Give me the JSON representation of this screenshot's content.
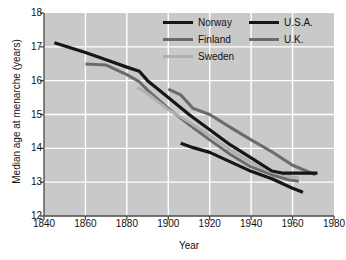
{
  "chart_data": {
    "type": "line",
    "title": "",
    "xlabel": "Year",
    "ylabel": "Median age at menarche (years)",
    "xlim": [
      1840,
      1980
    ],
    "ylim": [
      12,
      18
    ],
    "xticks": [
      1840,
      1860,
      1880,
      1900,
      1920,
      1940,
      1960,
      1980
    ],
    "yticks": [
      12,
      13,
      14,
      15,
      16,
      17,
      18
    ],
    "grid": true,
    "legend_position": "top-right",
    "series": [
      {
        "name": "Norway",
        "color": "#161616",
        "width": 3.2,
        "points": [
          [
            1845,
            17.12
          ],
          [
            1860,
            16.83
          ],
          [
            1870,
            16.62
          ],
          [
            1880,
            16.4
          ],
          [
            1886,
            16.28
          ],
          [
            1890,
            16.0
          ],
          [
            1900,
            15.5
          ],
          [
            1910,
            15.0
          ],
          [
            1920,
            14.55
          ],
          [
            1930,
            14.1
          ],
          [
            1940,
            13.72
          ],
          [
            1950,
            13.33
          ],
          [
            1955,
            13.27
          ],
          [
            1963,
            13.27
          ],
          [
            1972,
            13.27
          ]
        ]
      },
      {
        "name": "Finland",
        "color": "#6b6b6b",
        "width": 3.0,
        "points": [
          [
            1860,
            16.49
          ],
          [
            1870,
            16.46
          ],
          [
            1880,
            16.18
          ],
          [
            1886,
            15.97
          ],
          [
            1890,
            15.72
          ],
          [
            1900,
            15.18
          ],
          [
            1910,
            14.7
          ],
          [
            1920,
            14.25
          ],
          [
            1930,
            13.82
          ],
          [
            1940,
            13.45
          ],
          [
            1950,
            13.22
          ],
          [
            1958,
            13.07
          ],
          [
            1963,
            13.03
          ]
        ]
      },
      {
        "name": "Sweden",
        "color": "#b0b0b0",
        "width": 3.0,
        "points": [
          [
            1885,
            15.8
          ],
          [
            1890,
            15.62
          ],
          [
            1900,
            15.14
          ],
          [
            1910,
            14.78
          ],
          [
            1920,
            14.38
          ],
          [
            1930,
            13.95
          ],
          [
            1940,
            13.58
          ],
          [
            1950,
            13.3
          ],
          [
            1958,
            13.18
          ],
          [
            1963,
            13.12
          ]
        ]
      },
      {
        "name": "U.S.A.",
        "color": "#161616",
        "width": 3.2,
        "points": [
          [
            1906,
            14.15
          ],
          [
            1912,
            14.02
          ],
          [
            1920,
            13.88
          ],
          [
            1930,
            13.6
          ],
          [
            1940,
            13.32
          ],
          [
            1950,
            13.1
          ],
          [
            1960,
            12.82
          ],
          [
            1965,
            12.7
          ]
        ]
      },
      {
        "name": "U.K.",
        "color": "#6b6b6b",
        "width": 3.0,
        "points": [
          [
            1900,
            15.75
          ],
          [
            1906,
            15.58
          ],
          [
            1912,
            15.18
          ],
          [
            1920,
            15.0
          ],
          [
            1930,
            14.62
          ],
          [
            1940,
            14.25
          ],
          [
            1950,
            13.9
          ],
          [
            1960,
            13.5
          ],
          [
            1971,
            13.22
          ]
        ]
      }
    ]
  },
  "legend": {
    "rows": [
      [
        {
          "label": "Norway",
          "color": "#161616"
        },
        {
          "label": "U.S.A.",
          "color": "#161616"
        }
      ],
      [
        {
          "label": "Finland",
          "color": "#6b6b6b"
        },
        {
          "label": "U.K.",
          "color": "#6b6b6b"
        }
      ],
      [
        {
          "label": "Sweden",
          "color": "#b0b0b0"
        },
        {
          "label": "",
          "color": "transparent"
        }
      ]
    ]
  },
  "axes": {
    "x_title": "Year",
    "y_title": "Median age at menarche (years)",
    "x_tick_labels": [
      "1840",
      "1860",
      "1880",
      "1900",
      "1920",
      "1940",
      "1960",
      "1980"
    ],
    "y_tick_labels": [
      "12",
      "13",
      "14",
      "15",
      "16",
      "17",
      "18"
    ]
  },
  "colors": {
    "plot_background": "#c9c9c9",
    "gridline": "#ffffff",
    "axis": "#4a4a4a",
    "text": "#111111"
  }
}
